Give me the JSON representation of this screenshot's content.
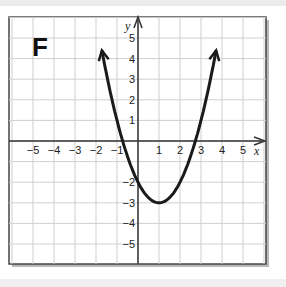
{
  "panel": {
    "label": "F"
  },
  "axes": {
    "x_label": "x",
    "y_label": "y",
    "x_ticks": [
      "−5",
      "−4",
      "−3",
      "−2",
      "−1",
      "1",
      "2",
      "3",
      "4",
      "5"
    ],
    "y_ticks": [
      "5",
      "4",
      "3",
      "2",
      "1",
      "−2",
      "−3",
      "−4",
      "−5"
    ]
  },
  "colors": {
    "curve": "#1a1a1a",
    "grid": "#cfcfcf",
    "axis": "#333333",
    "frame": "#444444"
  },
  "chart_data": {
    "type": "line",
    "title": "F",
    "xlabel": "x",
    "ylabel": "y",
    "function": "y = (x - 1)^2 - 3",
    "vertex": [
      1,
      -3
    ],
    "x_intercepts": [
      -0.73,
      2.73
    ],
    "y_intercept": -2,
    "x": [
      -1.7,
      -1.5,
      -1,
      -0.5,
      0,
      0.5,
      1,
      1.5,
      2,
      2.5,
      3,
      3.5,
      3.7
    ],
    "y": [
      4.29,
      3.25,
      1,
      -0.75,
      -2,
      -2.75,
      -3,
      -2.75,
      -2,
      -0.75,
      1,
      3.25,
      4.29
    ],
    "xlim": [
      -6,
      6
    ],
    "ylim": [
      -6,
      6
    ],
    "x_tick_values": [
      -5,
      -4,
      -3,
      -2,
      -1,
      1,
      2,
      3,
      4,
      5
    ],
    "y_tick_values": [
      5,
      4,
      3,
      2,
      1,
      -2,
      -3,
      -4,
      -5
    ],
    "grid": true,
    "arrows_on_ends": true
  }
}
